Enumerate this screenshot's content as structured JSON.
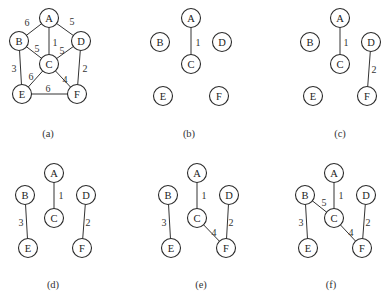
{
  "figure": {
    "node_radius": 9.5,
    "panels": [
      {
        "id": "a",
        "caption": "(a)",
        "caption_pos": [
          48,
          133
        ],
        "nodes": {
          "A": [
            49,
            18
          ],
          "B": [
            19,
            41
          ],
          "C": [
            49,
            64
          ],
          "D": [
            81,
            41
          ],
          "E": [
            22,
            94
          ],
          "F": [
            77,
            94
          ]
        },
        "edges": [
          {
            "from": "A",
            "to": "B",
            "weight": "6",
            "label_pos": [
              27,
              22
            ]
          },
          {
            "from": "A",
            "to": "D",
            "weight": "5",
            "label_pos": [
              72,
              21
            ]
          },
          {
            "from": "A",
            "to": "C",
            "weight": "1",
            "label_pos": [
              55,
              42
            ]
          },
          {
            "from": "B",
            "to": "C",
            "weight": "5",
            "label_pos": [
              37,
              48
            ]
          },
          {
            "from": "D",
            "to": "C",
            "weight": "5",
            "label_pos": [
              62,
              50
            ]
          },
          {
            "from": "B",
            "to": "E",
            "weight": "3",
            "label_pos": [
              14,
              68
            ]
          },
          {
            "from": "D",
            "to": "F",
            "weight": "2",
            "label_pos": [
              85,
              68
            ]
          },
          {
            "from": "C",
            "to": "E",
            "weight": "6",
            "label_pos": [
              31,
              76
            ]
          },
          {
            "from": "C",
            "to": "F",
            "weight": "4",
            "label_pos": [
              65,
              79
            ]
          },
          {
            "from": "E",
            "to": "F",
            "weight": "6",
            "label_pos": [
              48,
              88
            ]
          }
        ]
      },
      {
        "id": "b",
        "caption": "(b)",
        "caption_pos": [
          189,
          133
        ],
        "nodes": {
          "A": [
            191,
            18
          ],
          "B": [
            160,
            42
          ],
          "C": [
            191,
            64
          ],
          "D": [
            222,
            42
          ],
          "E": [
            163,
            96
          ],
          "F": [
            219,
            96
          ]
        },
        "edges": [
          {
            "from": "A",
            "to": "C",
            "weight": "1",
            "label_pos": [
              198,
              42
            ]
          }
        ]
      },
      {
        "id": "c",
        "caption": "(c)",
        "caption_pos": [
          340,
          133
        ],
        "nodes": {
          "A": [
            340,
            18
          ],
          "B": [
            310,
            42
          ],
          "C": [
            340,
            64
          ],
          "D": [
            371,
            42
          ],
          "E": [
            313,
            96
          ],
          "F": [
            367,
            96
          ]
        },
        "edges": [
          {
            "from": "A",
            "to": "C",
            "weight": "1",
            "label_pos": [
              346,
              42
            ]
          },
          {
            "from": "D",
            "to": "F",
            "weight": "2",
            "label_pos": [
              374,
              69
            ]
          }
        ]
      },
      {
        "id": "d",
        "caption": "(d)",
        "caption_pos": [
          53,
          284
        ],
        "nodes": {
          "A": [
            54,
            173
          ],
          "B": [
            25,
            195
          ],
          "C": [
            54,
            218
          ],
          "D": [
            86,
            195
          ],
          "E": [
            28,
            248
          ],
          "F": [
            82,
            248
          ]
        },
        "edges": [
          {
            "from": "A",
            "to": "C",
            "weight": "1",
            "label_pos": [
              61,
              195
            ]
          },
          {
            "from": "B",
            "to": "E",
            "weight": "3",
            "label_pos": [
              21,
              222
            ]
          },
          {
            "from": "D",
            "to": "F",
            "weight": "2",
            "label_pos": [
              88,
              222
            ]
          }
        ]
      },
      {
        "id": "e",
        "caption": "(e)",
        "caption_pos": [
          201,
          284
        ],
        "nodes": {
          "A": [
            197,
            173
          ],
          "B": [
            168,
            195
          ],
          "C": [
            197,
            218
          ],
          "D": [
            229,
            195
          ],
          "E": [
            171,
            248
          ],
          "F": [
            226,
            248
          ]
        },
        "edges": [
          {
            "from": "A",
            "to": "C",
            "weight": "1",
            "label_pos": [
              204,
              195
            ]
          },
          {
            "from": "B",
            "to": "E",
            "weight": "3",
            "label_pos": [
              164,
              222
            ]
          },
          {
            "from": "D",
            "to": "F",
            "weight": "2",
            "label_pos": [
              231,
              222
            ]
          },
          {
            "from": "C",
            "to": "F",
            "weight": "4",
            "label_pos": [
              214,
              232
            ]
          }
        ]
      },
      {
        "id": "f",
        "caption": "(f)",
        "caption_pos": [
          331,
          284
        ],
        "nodes": {
          "A": [
            334,
            173
          ],
          "B": [
            305,
            195
          ],
          "C": [
            334,
            218
          ],
          "D": [
            366,
            195
          ],
          "E": [
            308,
            248
          ],
          "F": [
            362,
            248
          ]
        },
        "edges": [
          {
            "from": "A",
            "to": "C",
            "weight": "1",
            "label_pos": [
              341,
              195
            ]
          },
          {
            "from": "B",
            "to": "C",
            "weight": "5",
            "label_pos": [
              324,
              202
            ]
          },
          {
            "from": "B",
            "to": "E",
            "weight": "3",
            "label_pos": [
              301,
              222
            ]
          },
          {
            "from": "D",
            "to": "F",
            "weight": "2",
            "label_pos": [
              368,
              222
            ]
          },
          {
            "from": "C",
            "to": "F",
            "weight": "4",
            "label_pos": [
              351,
              232
            ]
          }
        ]
      }
    ]
  }
}
